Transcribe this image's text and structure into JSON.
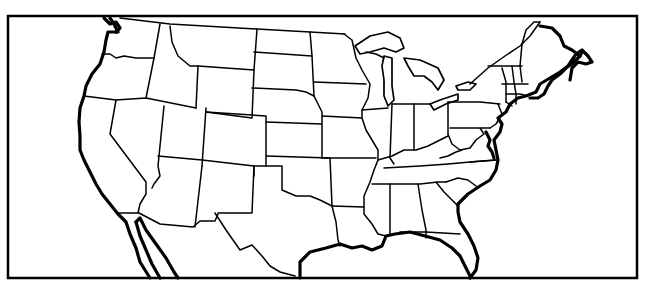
{
  "map": {
    "title": "",
    "type": "outline map",
    "region": "Contiguous United States",
    "labels": [],
    "colors": {
      "background": "#ffffff",
      "lines": "#000000"
    },
    "frame": {
      "x": 8,
      "y": 16,
      "width": 629,
      "height": 262
    }
  }
}
